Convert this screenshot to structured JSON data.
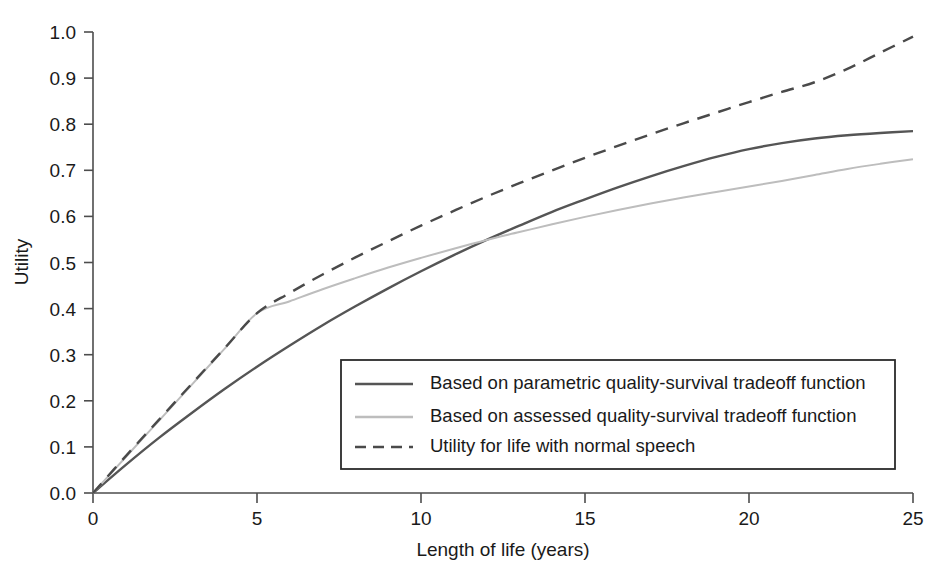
{
  "chart_data": {
    "type": "line",
    "title": "",
    "xlabel": "Length of life (years)",
    "ylabel": "Utility",
    "xlim": [
      0,
      25
    ],
    "ylim": [
      0.0,
      1.0
    ],
    "grid": false,
    "legend_position": "inside-lower-right",
    "xticks": [
      "0",
      "5",
      "10",
      "15",
      "20",
      "25"
    ],
    "xtick_values": [
      0,
      5,
      10,
      15,
      20,
      25
    ],
    "yticks": [
      "0.0",
      "0.1",
      "0.2",
      "0.3",
      "0.4",
      "0.5",
      "0.6",
      "0.7",
      "0.8",
      "0.9",
      "1.0"
    ],
    "ytick_values": [
      0.0,
      0.1,
      0.2,
      0.3,
      0.4,
      0.5,
      0.6,
      0.7,
      0.8,
      0.9,
      1.0
    ],
    "x": [
      0,
      1,
      2,
      3,
      4,
      5,
      6,
      7,
      8,
      9,
      10,
      11,
      12,
      13,
      14,
      15,
      16,
      17,
      18,
      19,
      20,
      21,
      22,
      23,
      24,
      25
    ],
    "series": [
      {
        "name": "Based on parametric quality-survival tradeoff function",
        "style": "solid",
        "color": "#555555",
        "width": 2.4,
        "values": [
          0.0,
          0.061,
          0.119,
          0.173,
          0.225,
          0.274,
          0.32,
          0.364,
          0.405,
          0.444,
          0.481,
          0.516,
          0.549,
          0.58,
          0.61,
          0.637,
          0.663,
          0.687,
          0.709,
          0.729,
          0.746,
          0.759,
          0.769,
          0.776,
          0.781,
          0.785
        ]
      },
      {
        "name": "Based on assessed quality-survival tradeoff function",
        "style": "solid",
        "color": "#bdbdbd",
        "width": 2.0,
        "values": [
          0.0,
          0.078,
          0.156,
          0.234,
          0.312,
          0.39,
          0.416,
          0.442,
          0.466,
          0.489,
          0.51,
          0.53,
          0.549,
          0.566,
          0.583,
          0.599,
          0.614,
          0.628,
          0.641,
          0.653,
          0.665,
          0.677,
          0.69,
          0.703,
          0.714,
          0.724
        ]
      },
      {
        "name": "Utility for life with normal speech",
        "style": "dashed",
        "color": "#4a4a4a",
        "width": 2.4,
        "values": [
          0.0,
          0.08,
          0.158,
          0.236,
          0.313,
          0.39,
          0.434,
          0.474,
          0.511,
          0.546,
          0.58,
          0.612,
          0.643,
          0.672,
          0.7,
          0.727,
          0.753,
          0.778,
          0.802,
          0.825,
          0.848,
          0.87,
          0.891,
          0.92,
          0.955,
          0.99
        ]
      }
    ],
    "legend": [
      {
        "label": "Based on parametric quality-survival tradeoff function",
        "style": "solid",
        "color": "#555555"
      },
      {
        "label": "Based on assessed quality-survival tradeoff function",
        "style": "solid",
        "color": "#bdbdbd"
      },
      {
        "label": "Utility for life with normal speech",
        "style": "dashed",
        "color": "#4a4a4a"
      }
    ]
  }
}
